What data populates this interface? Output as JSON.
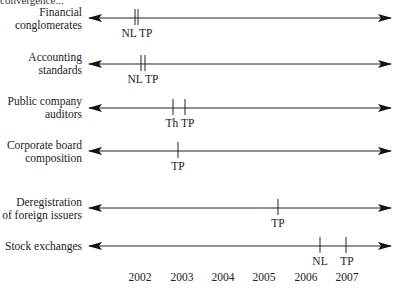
{
  "caption_fragment": "convergence...",
  "axis": {
    "years": [
      "2002",
      "2003",
      "2004",
      "2005",
      "2006",
      "2007"
    ],
    "year_x": [
      140,
      182,
      223,
      264,
      306,
      347
    ]
  },
  "legend_abbreviations": [
    "NL",
    "TP",
    "Th"
  ],
  "rows": [
    {
      "label_lines": [
        "Financial",
        "conglomerates"
      ],
      "line_y": 18,
      "label_top": 6,
      "markers": [
        {
          "x": 135,
          "label": ""
        },
        {
          "x": 138,
          "label": ""
        }
      ],
      "marker_text": "NL TP",
      "marker_text_x": 137,
      "marker_text_y": 28
    },
    {
      "label_lines": [
        "Accounting",
        "standards"
      ],
      "line_y": 64,
      "label_top": 51,
      "markers": [
        {
          "x": 141,
          "label": ""
        },
        {
          "x": 145,
          "label": ""
        }
      ],
      "marker_text": "NL TP",
      "marker_text_x": 143,
      "marker_text_y": 74
    },
    {
      "label_lines": [
        "Public company",
        "auditors"
      ],
      "line_y": 108,
      "label_top": 95,
      "markers": [
        {
          "x": 173,
          "label": ""
        },
        {
          "x": 185,
          "label": ""
        }
      ],
      "marker_text": "Th TP",
      "marker_text_x": 180,
      "marker_text_y": 118
    },
    {
      "label_lines": [
        "Corporate board",
        "composition"
      ],
      "line_y": 151,
      "label_top": 139,
      "markers": [
        {
          "x": 178,
          "label": "TP"
        }
      ],
      "marker_text": "",
      "marker_text_y": 161
    },
    {
      "label_lines": [
        "Deregistration",
        "of foreign issuers"
      ],
      "line_y": 208,
      "label_top": 196,
      "markers": [
        {
          "x": 278,
          "label": "TP"
        }
      ],
      "marker_text": "",
      "marker_text_y": 218
    },
    {
      "label_lines": [
        "Stock exchanges"
      ],
      "line_y": 246,
      "label_top": 240,
      "markers": [
        {
          "x": 320,
          "label": "NL"
        },
        {
          "x": 346,
          "label": "TP"
        }
      ],
      "marker_text": "",
      "marker_text_y": 256
    }
  ]
}
